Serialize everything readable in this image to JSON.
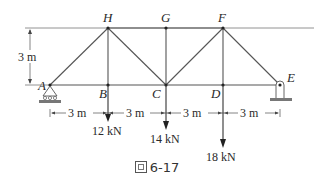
{
  "diagram": {
    "nodes": [
      {
        "id": "A",
        "label": "A",
        "x": 50,
        "y": 85
      },
      {
        "id": "B",
        "label": "B",
        "x": 108,
        "y": 85
      },
      {
        "id": "C",
        "label": "C",
        "x": 166,
        "y": 85
      },
      {
        "id": "D",
        "label": "D",
        "x": 223,
        "y": 85
      },
      {
        "id": "E",
        "label": "E",
        "x": 280,
        "y": 85
      },
      {
        "id": "H",
        "label": "H",
        "x": 108,
        "y": 28
      },
      {
        "id": "G",
        "label": "G",
        "x": 166,
        "y": 28
      },
      {
        "id": "F",
        "label": "F",
        "x": 223,
        "y": 28
      }
    ],
    "members": [
      [
        "A",
        "B"
      ],
      [
        "B",
        "C"
      ],
      [
        "C",
        "D"
      ],
      [
        "D",
        "E"
      ],
      [
        "H",
        "G"
      ],
      [
        "G",
        "F"
      ],
      [
        "A",
        "H"
      ],
      [
        "H",
        "B"
      ],
      [
        "H",
        "C"
      ],
      [
        "G",
        "C"
      ],
      [
        "C",
        "F"
      ],
      [
        "F",
        "D"
      ],
      [
        "F",
        "E"
      ]
    ],
    "height_label": "3 m",
    "spans": [
      "3 m",
      "3 m",
      "3 m",
      "3 m"
    ],
    "loads": [
      {
        "node": "B",
        "label": "12 kN"
      },
      {
        "node": "C",
        "label": "14 kN"
      },
      {
        "node": "D",
        "label": "18 kN"
      }
    ],
    "supports": {
      "A": "pin-roller",
      "E": "pin-hanger"
    },
    "colors": {
      "line": "#555555",
      "text": "#2a2a2a"
    }
  },
  "caption": {
    "icon": "figure-glyph",
    "text": "6-17"
  }
}
